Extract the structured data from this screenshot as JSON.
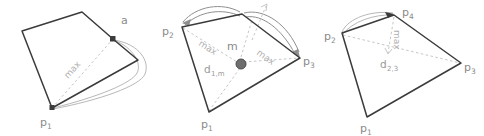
{
  "figure": {
    "title": "",
    "background_color": "#ffffff",
    "panel_count": 3
  },
  "colors": {
    "edge": "#3b3b3b",
    "dashed": "#c6c6c6",
    "hull_curve": "#b8b8b8",
    "arrow": "#8f8f8f",
    "label": "#8a8a8a",
    "max_label": "#b0b0b0",
    "marker": "#3b3b3b",
    "centroid": "#6e6e6e"
  },
  "panels": [
    {
      "id": "panel-1",
      "labels": {
        "p1": {
          "base": "p",
          "sub": "1"
        },
        "a": {
          "base": "a",
          "sub": ""
        },
        "max": "max"
      }
    },
    {
      "id": "panel-2",
      "labels": {
        "p1": {
          "base": "p",
          "sub": "1"
        },
        "p2": {
          "base": "p",
          "sub": "2"
        },
        "p3": {
          "base": "p",
          "sub": "3"
        },
        "m": "m",
        "max_left": "max",
        "max_right": "max",
        "distance": {
          "base": "d",
          "sub": "1,m"
        }
      }
    },
    {
      "id": "panel-3",
      "labels": {
        "p1": {
          "base": "p",
          "sub": "1"
        },
        "p2": {
          "base": "p",
          "sub": "2"
        },
        "p3": {
          "base": "p",
          "sub": "3"
        },
        "p4": {
          "base": "p",
          "sub": "4"
        },
        "max": "max",
        "distance": {
          "base": "d",
          "sub": "2,3"
        }
      }
    }
  ]
}
